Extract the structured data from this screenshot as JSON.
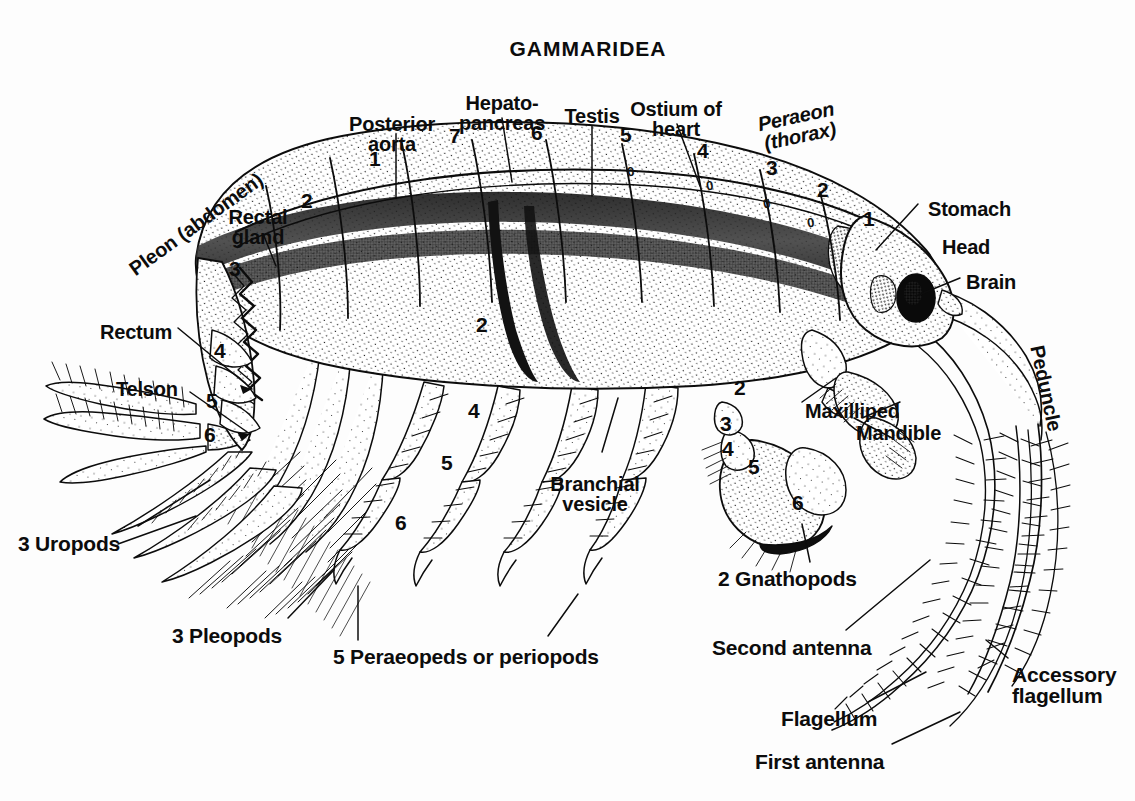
{
  "plate": {
    "title": "GAMMARIDEA",
    "organism": "amphipod crustacean — lateral dissection diagram",
    "background_color": "#fdfdfd",
    "ink_color": "#0c0c0c"
  },
  "labels": [
    {
      "id": "title",
      "text": "GAMMARIDEA",
      "x": 588,
      "y": 38,
      "size": 21,
      "align": "center",
      "rotate": 0,
      "italic": false
    },
    {
      "id": "posterior-aorta",
      "text": "Posterior\naorta",
      "x": 392,
      "y": 114,
      "size": 20,
      "align": "center",
      "rotate": 0,
      "italic": false
    },
    {
      "id": "hepatopancreas",
      "text": "Hepato-\npancreas",
      "x": 502,
      "y": 93,
      "size": 20,
      "align": "center",
      "rotate": 0,
      "italic": false
    },
    {
      "id": "testis",
      "text": "Testis",
      "x": 592,
      "y": 106,
      "size": 20,
      "align": "center",
      "rotate": 0,
      "italic": false
    },
    {
      "id": "ostium-of-heart",
      "text": "Ostium of\nheart",
      "x": 676,
      "y": 99,
      "size": 20,
      "align": "center",
      "rotate": 0,
      "italic": false
    },
    {
      "id": "peraeon-thorax",
      "text": "Peraeon\n(thorax)",
      "x": 798,
      "y": 106,
      "size": 20,
      "align": "center",
      "rotate": -12,
      "italic": true
    },
    {
      "id": "pleon-abdomen",
      "text": "Pleon (abdomen)",
      "x": 196,
      "y": 214,
      "size": 20,
      "align": "center",
      "rotate": -36,
      "italic": false
    },
    {
      "id": "rectal-gland",
      "text": "Rectal\ngland",
      "x": 258,
      "y": 207,
      "size": 20,
      "align": "center",
      "rotate": 0,
      "italic": false
    },
    {
      "id": "stomach",
      "text": "Stomach",
      "x": 928,
      "y": 199,
      "size": 20,
      "align": "left",
      "rotate": 0,
      "italic": false
    },
    {
      "id": "head",
      "text": "Head",
      "x": 942,
      "y": 237,
      "size": 20,
      "align": "left",
      "rotate": 0,
      "italic": false
    },
    {
      "id": "brain",
      "text": "Brain",
      "x": 966,
      "y": 272,
      "size": 20,
      "align": "left",
      "rotate": 0,
      "italic": false
    },
    {
      "id": "rectum",
      "text": "Rectum",
      "x": 100,
      "y": 322,
      "size": 20,
      "align": "left",
      "rotate": 0,
      "italic": false
    },
    {
      "id": "telson",
      "text": "Telson",
      "x": 116,
      "y": 379,
      "size": 20,
      "align": "left",
      "rotate": 0,
      "italic": false
    },
    {
      "id": "peduncle",
      "text": "Peduncle",
      "x": 1046,
      "y": 378,
      "size": 20,
      "align": "center",
      "rotate": 78,
      "italic": false
    },
    {
      "id": "maxilliped",
      "text": "Maxilliped",
      "x": 805,
      "y": 401,
      "size": 20,
      "align": "left",
      "rotate": 0,
      "italic": false
    },
    {
      "id": "mandible",
      "text": "Mandible",
      "x": 856,
      "y": 423,
      "size": 20,
      "align": "left",
      "rotate": 0,
      "italic": false
    },
    {
      "id": "branchial-vesicle",
      "text": "Branchial\nvesicle",
      "x": 595,
      "y": 474,
      "size": 20,
      "align": "center",
      "rotate": 0,
      "italic": false
    },
    {
      "id": "three-uropods",
      "text": "3 Uropods",
      "x": 18,
      "y": 533,
      "size": 21,
      "align": "left",
      "rotate": 0,
      "italic": false
    },
    {
      "id": "three-pleopods",
      "text": "3 Pleopods",
      "x": 172,
      "y": 625,
      "size": 21,
      "align": "left",
      "rotate": 0,
      "italic": false
    },
    {
      "id": "two-gnathopods",
      "text": "2 Gnathopods",
      "x": 718,
      "y": 568,
      "size": 21,
      "align": "left",
      "rotate": 0,
      "italic": false
    },
    {
      "id": "five-peraeopeds",
      "text": "5 Peraeopeds or periopods",
      "x": 333,
      "y": 646,
      "size": 21,
      "align": "left",
      "rotate": 0,
      "italic": false
    },
    {
      "id": "second-antenna",
      "text": "Second antenna",
      "x": 712,
      "y": 637,
      "size": 21,
      "align": "left",
      "rotate": 0,
      "italic": false
    },
    {
      "id": "accessory-flagellum",
      "text": "Accessory\nflagellum",
      "x": 1012,
      "y": 664,
      "size": 21,
      "align": "left",
      "rotate": 0,
      "italic": false
    },
    {
      "id": "flagellum",
      "text": "Flagellum",
      "x": 781,
      "y": 708,
      "size": 21,
      "align": "left",
      "rotate": 0,
      "italic": false
    },
    {
      "id": "first-antenna",
      "text": "First antenna",
      "x": 755,
      "y": 751,
      "size": 21,
      "align": "left",
      "rotate": 0,
      "italic": false
    }
  ],
  "segment_numbers": [
    {
      "id": "pleon-1",
      "text": "1",
      "x": 369,
      "y": 148,
      "group": "pleon"
    },
    {
      "id": "pleon-2",
      "text": "2",
      "x": 301,
      "y": 190,
      "group": "pleon"
    },
    {
      "id": "pleon-3",
      "text": "3",
      "x": 229,
      "y": 258,
      "group": "pleon"
    },
    {
      "id": "pleon-4",
      "text": "4",
      "x": 214,
      "y": 340,
      "group": "pleon"
    },
    {
      "id": "pleon-5",
      "text": "5",
      "x": 206,
      "y": 390,
      "group": "pleon"
    },
    {
      "id": "pleon-6",
      "text": "6",
      "x": 204,
      "y": 424,
      "group": "pleon"
    },
    {
      "id": "peraeon-7",
      "text": "7",
      "x": 449,
      "y": 125,
      "group": "peraeon"
    },
    {
      "id": "peraeon-6",
      "text": "6",
      "x": 531,
      "y": 122,
      "group": "peraeon"
    },
    {
      "id": "peraeon-5",
      "text": "5",
      "x": 620,
      "y": 124,
      "group": "peraeon"
    },
    {
      "id": "peraeon-4",
      "text": "4",
      "x": 697,
      "y": 140,
      "group": "peraeon"
    },
    {
      "id": "peraeon-3",
      "text": "3",
      "x": 766,
      "y": 157,
      "group": "peraeon"
    },
    {
      "id": "peraeon-2",
      "text": "2",
      "x": 817,
      "y": 179,
      "group": "peraeon"
    },
    {
      "id": "peraeon-1",
      "text": "1",
      "x": 863,
      "y": 208,
      "group": "peraeon"
    },
    {
      "id": "leg-a-2",
      "text": "2",
      "x": 476,
      "y": 314,
      "group": "peraeopod"
    },
    {
      "id": "leg-a-4",
      "text": "4",
      "x": 468,
      "y": 400,
      "group": "peraeopod"
    },
    {
      "id": "leg-a-5",
      "text": "5",
      "x": 441,
      "y": 452,
      "group": "peraeopod"
    },
    {
      "id": "leg-a-6",
      "text": "6",
      "x": 395,
      "y": 512,
      "group": "peraeopod"
    },
    {
      "id": "gnath-2",
      "text": "2",
      "x": 734,
      "y": 377,
      "group": "gnathopod"
    },
    {
      "id": "gnath-3",
      "text": "3",
      "x": 720,
      "y": 413,
      "group": "gnathopod"
    },
    {
      "id": "gnath-4",
      "text": "4",
      "x": 722,
      "y": 438,
      "group": "gnathopod"
    },
    {
      "id": "gnath-5",
      "text": "5",
      "x": 748,
      "y": 456,
      "group": "gnathopod"
    },
    {
      "id": "gnath-6",
      "text": "6",
      "x": 792,
      "y": 492,
      "group": "gnathopod"
    }
  ],
  "ostia_marks": [
    {
      "id": "ostium-5",
      "text": "0",
      "x": 627,
      "y": 164
    },
    {
      "id": "ostium-4",
      "text": "0",
      "x": 706,
      "y": 178
    },
    {
      "id": "ostium-3",
      "text": "0",
      "x": 763,
      "y": 196
    },
    {
      "id": "ostium-2",
      "text": "0",
      "x": 807,
      "y": 215
    }
  ]
}
